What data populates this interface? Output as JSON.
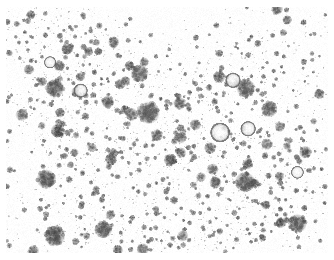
{
  "image": {
    "kind": "micrograph",
    "modality": "brightfield-cell-culture",
    "caption": "",
    "background_color": "#ffffff",
    "cell_dark_color": "#4a4a4a",
    "cell_mid_color": "#8c8c8c",
    "cell_light_color": "#c8c8c8",
    "debris_color": "#9a9a9a",
    "width_px": 334,
    "height_px": 260,
    "field": {
      "x": 6,
      "y": 7,
      "width": 322,
      "height": 246
    },
    "overlay_text": "",
    "scale_bar_text": "",
    "annotations": []
  },
  "render": {
    "seed": 20240517,
    "cluster_count": 9,
    "cell_count": 760,
    "debris_count": 2600,
    "clusters": [
      {
        "cx": 0.14,
        "cy": 0.22,
        "r": 0.14,
        "density": 0.8
      },
      {
        "cx": 0.3,
        "cy": 0.16,
        "r": 0.13,
        "density": 0.7
      },
      {
        "cx": 0.24,
        "cy": 0.52,
        "r": 0.18,
        "density": 1.0
      },
      {
        "cx": 0.4,
        "cy": 0.66,
        "r": 0.17,
        "density": 0.98
      },
      {
        "cx": 0.56,
        "cy": 0.4,
        "r": 0.15,
        "density": 0.88
      },
      {
        "cx": 0.66,
        "cy": 0.62,
        "r": 0.16,
        "density": 0.92
      },
      {
        "cx": 0.82,
        "cy": 0.24,
        "r": 0.13,
        "density": 0.66
      },
      {
        "cx": 0.88,
        "cy": 0.72,
        "r": 0.12,
        "density": 0.62
      },
      {
        "cx": 0.52,
        "cy": 0.9,
        "r": 0.16,
        "density": 0.8
      }
    ],
    "sparse_regions": [
      {
        "cx": 0.46,
        "cy": 0.1,
        "r": 0.12
      },
      {
        "cx": 0.72,
        "cy": 0.46,
        "r": 0.09
      },
      {
        "cx": 0.06,
        "cy": 0.62,
        "r": 0.08
      }
    ],
    "bright_cells": [
      {
        "x": 0.665,
        "y": 0.51,
        "r": 0.031
      },
      {
        "x": 0.752,
        "y": 0.495,
        "r": 0.024
      },
      {
        "x": 0.705,
        "y": 0.298,
        "r": 0.024
      },
      {
        "x": 0.232,
        "y": 0.34,
        "r": 0.022
      },
      {
        "x": 0.905,
        "y": 0.672,
        "r": 0.02
      },
      {
        "x": 0.137,
        "y": 0.225,
        "r": 0.019
      }
    ],
    "large_cells": [
      {
        "x": 0.443,
        "y": 0.43,
        "r": 0.036,
        "tone": 0.44
      },
      {
        "x": 0.152,
        "y": 0.33,
        "r": 0.03,
        "tone": 0.4
      },
      {
        "x": 0.125,
        "y": 0.7,
        "r": 0.031,
        "tone": 0.36
      },
      {
        "x": 0.152,
        "y": 0.93,
        "r": 0.033,
        "tone": 0.34
      },
      {
        "x": 0.745,
        "y": 0.33,
        "r": 0.03,
        "tone": 0.42
      },
      {
        "x": 0.742,
        "y": 0.712,
        "r": 0.032,
        "tone": 0.4
      },
      {
        "x": 0.905,
        "y": 0.88,
        "r": 0.03,
        "tone": 0.4
      },
      {
        "x": 0.415,
        "y": 0.27,
        "r": 0.029,
        "tone": 0.46
      },
      {
        "x": 0.302,
        "y": 0.905,
        "r": 0.028,
        "tone": 0.4
      },
      {
        "x": 0.818,
        "y": 0.415,
        "r": 0.026,
        "tone": 0.44
      }
    ]
  }
}
